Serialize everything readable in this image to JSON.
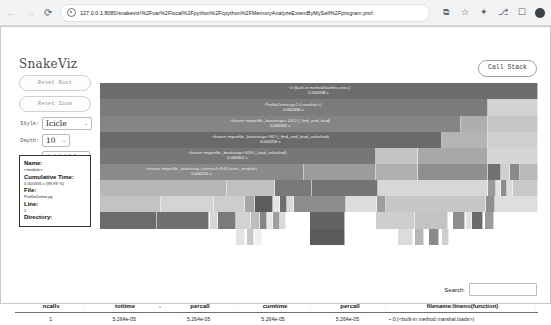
{
  "browser": {
    "url": "127.0.0.1:8080/snakeviz/%2Fvar%2Flocal%2Fpython%2Fcpython%2FMemoryAnalyzeExtemByMySelf%2Fprogram.prof",
    "nav_back": "←",
    "nav_forward": "→",
    "nav_reload": "⟳",
    "icons": {
      "site_info": "site-info-icon",
      "install": "⧉",
      "bookmark": "☆",
      "extensions": "✦",
      "split": "⎇",
      "sidepanel": "☐",
      "profile": "profile-avatar"
    }
  },
  "app": {
    "brand": "SnakeViz",
    "call_stack_button": "Call Stack"
  },
  "controls": {
    "reset_root": "Reset Root",
    "reset_zoom": "Reset Zoom",
    "style_label": "Style:",
    "style_value": "Icicle",
    "depth_label": "Depth:",
    "depth_value": "10",
    "cutoff_label": "Cutoff:",
    "cutoff_value": "1 / 1000",
    "caret": "⌄"
  },
  "info": {
    "name_label": "Name:",
    "name_value": "<module>",
    "cumulative_label": "Cumulative Time:",
    "cumulative_value": "0.000336 s (99.99 %)",
    "file_label": "File:",
    "file_value": "ProfileDemo.py",
    "line_label": "Line:",
    "line_value": "1",
    "directory_label": "Directory:",
    "directory_value": ""
  },
  "flame": {
    "rows": [
      {
        "top": 0,
        "height": 16,
        "cells": [
          {
            "left": 0,
            "width": 100,
            "color": "#6d6d6d",
            "tone": "dark",
            "label": "~:0:(built-in method builtins.exec)",
            "time": "0.000338 s"
          }
        ]
      },
      {
        "top": 16,
        "height": 17,
        "cells": [
          {
            "left": 0,
            "width": 88.5,
            "color": "#7c7c7c",
            "tone": "dark",
            "label": "ProfileDemo.py:1:(<module>)",
            "time": "0.000336 s"
          },
          {
            "left": 88.5,
            "width": 11.5,
            "color": "#d2d2d2",
            "tone": "light",
            "label": "",
            "time": ""
          }
        ]
      },
      {
        "top": 33,
        "height": 16,
        "cells": [
          {
            "left": 0,
            "width": 82.5,
            "color": "#858585",
            "tone": "dark",
            "label": "<frozen importlib._bootstrap>:1002:(_find_and_load)",
            "time": "0.000332 s"
          },
          {
            "left": 82.5,
            "width": 6.0,
            "color": "#aeaeae",
            "tone": "light",
            "label": "",
            "time": ""
          },
          {
            "left": 88.5,
            "width": 11.5,
            "color": "#c6c6c6",
            "tone": "light",
            "label": "",
            "time": ""
          }
        ]
      },
      {
        "top": 49,
        "height": 16,
        "cells": [
          {
            "left": 0,
            "width": 78.0,
            "color": "#6a6a6a",
            "tone": "dark",
            "label": "<frozen importlib._bootstrap>:967:(_find_and_load_unlocked)",
            "time": "0.000316 s"
          },
          {
            "left": 78.0,
            "width": 10.5,
            "color": "#b4b4b4",
            "tone": "light",
            "label": "",
            "time": ""
          },
          {
            "left": 88.5,
            "width": 11.5,
            "color": "#cfcfcf",
            "tone": "light",
            "label": "",
            "time": ""
          }
        ]
      },
      {
        "top": 65,
        "height": 16,
        "cells": [
          {
            "left": 0,
            "width": 63.0,
            "color": "#777777",
            "tone": "dark",
            "label": "<frozen importlib._bootstrap>:659:(_load_unlocked)",
            "time": "0.000302 s"
          },
          {
            "left": 63.0,
            "width": 9.5,
            "color": "#c4c4c4",
            "tone": "light",
            "label": "",
            "time": ""
          },
          {
            "left": 72.5,
            "width": 16.0,
            "color": "#a8a8a8",
            "tone": "light",
            "label": "",
            "time": ""
          },
          {
            "left": 88.5,
            "width": 11.5,
            "color": "#d6d6d6",
            "tone": "light",
            "label": "",
            "time": ""
          }
        ]
      },
      {
        "top": 81,
        "height": 16,
        "cells": [
          {
            "left": 0,
            "width": 46.5,
            "color": "#8a8a8a",
            "tone": "dark",
            "label": "<frozen importlib._bootstrap_external>:844:(exec_module)",
            "time": "0.000155 s"
          },
          {
            "left": 46.5,
            "width": 16.5,
            "color": "#9c9c9c",
            "tone": "light",
            "label": "",
            "time": ""
          },
          {
            "left": 63.0,
            "width": 9.5,
            "color": "#b0b0b0",
            "tone": "light",
            "label": "",
            "time": ""
          },
          {
            "left": 72.5,
            "width": 16.0,
            "color": "#8f8f8f",
            "tone": "light",
            "label": "",
            "time": ""
          },
          {
            "left": 88.5,
            "width": 3.0,
            "color": "#717171",
            "tone": "light",
            "label": "",
            "time": ""
          },
          {
            "left": 91.5,
            "width": 2.0,
            "color": "#cfcfcf",
            "tone": "light",
            "label": "",
            "time": ""
          },
          {
            "left": 93.5,
            "width": 2.5,
            "color": "#8a8a8a",
            "tone": "light",
            "label": "",
            "time": ""
          },
          {
            "left": 96.0,
            "width": 4.0,
            "color": "#b9b9b9",
            "tone": "light",
            "label": "",
            "time": ""
          }
        ]
      },
      {
        "top": 97,
        "height": 16,
        "cells": [
          {
            "left": 0,
            "width": 29.0,
            "color": "#b7b7b7",
            "tone": "light",
            "label": "",
            "time": ""
          },
          {
            "left": 29.0,
            "width": 11.0,
            "color": "#c0c0c0",
            "tone": "light",
            "label": "",
            "time": ""
          },
          {
            "left": 40.0,
            "width": 8.5,
            "color": "#787878",
            "tone": "light",
            "label": "",
            "time": ""
          },
          {
            "left": 48.5,
            "width": 15.0,
            "color": "#747474",
            "tone": "light",
            "label": "",
            "time": ""
          },
          {
            "left": 63.5,
            "width": 25.0,
            "color": "#d7d7d7",
            "tone": "light",
            "label": "",
            "time": ""
          },
          {
            "left": 88.5,
            "width": 1.8,
            "color": "#9a9a9a",
            "tone": "light",
            "label": "",
            "time": ""
          },
          {
            "left": 90.3,
            "width": 1.2,
            "color": "#e2e2e2",
            "tone": "light",
            "label": "",
            "time": ""
          },
          {
            "left": 91.5,
            "width": 1.5,
            "color": "#8d8d8d",
            "tone": "light",
            "label": "",
            "time": ""
          },
          {
            "left": 93.0,
            "width": 1.3,
            "color": "#dcdcdc",
            "tone": "light",
            "label": "",
            "time": ""
          },
          {
            "left": 94.3,
            "width": 5.7,
            "color": "#c9c9c9",
            "tone": "light",
            "label": "",
            "time": ""
          }
        ]
      },
      {
        "top": 113,
        "height": 16,
        "cells": [
          {
            "left": 0,
            "width": 14.0,
            "color": "#c3c3c3",
            "tone": "light",
            "label": "",
            "time": ""
          },
          {
            "left": 14.0,
            "width": 12.0,
            "color": "#d4d4d4",
            "tone": "light",
            "label": "",
            "time": ""
          },
          {
            "left": 26.0,
            "width": 7.0,
            "color": "#cdcdcd",
            "tone": "light",
            "label": "",
            "time": ""
          },
          {
            "left": 33.0,
            "width": 2.5,
            "color": "#a5a5a5",
            "tone": "light",
            "label": "",
            "time": ""
          },
          {
            "left": 35.5,
            "width": 4.0,
            "color": "#5c5c5c",
            "tone": "light",
            "label": "",
            "time": ""
          },
          {
            "left": 39.5,
            "width": 1.5,
            "color": "#e4e4e4",
            "tone": "light",
            "label": "",
            "time": ""
          },
          {
            "left": 41.0,
            "width": 1.8,
            "color": "#6f6f6f",
            "tone": "light",
            "label": "",
            "time": ""
          },
          {
            "left": 42.8,
            "width": 1.4,
            "color": "#d8d8d8",
            "tone": "light",
            "label": "",
            "time": ""
          },
          {
            "left": 44.2,
            "width": 12.0,
            "color": "#8c8c8c",
            "tone": "light",
            "label": "",
            "time": ""
          },
          {
            "left": 56.2,
            "width": 7.0,
            "color": "#dcdcdc",
            "tone": "light",
            "label": "",
            "time": ""
          },
          {
            "left": 63.2,
            "width": 2.0,
            "color": "#9d9d9d",
            "tone": "light",
            "label": "",
            "time": ""
          },
          {
            "left": 65.2,
            "width": 23.0,
            "color": "#c7c7c7",
            "tone": "light",
            "label": "",
            "time": ""
          },
          {
            "left": 88.2,
            "width": 2.0,
            "color": "#8f8f8f",
            "tone": "light",
            "label": "",
            "time": ""
          },
          {
            "left": 90.2,
            "width": 9.8,
            "color": "#dedede",
            "tone": "light",
            "label": "",
            "time": ""
          }
        ]
      },
      {
        "top": 129,
        "height": 17,
        "cells": [
          {
            "left": 0,
            "width": 13.0,
            "color": "#6b6b6b",
            "tone": "light",
            "label": "",
            "time": ""
          },
          {
            "left": 13.0,
            "width": 12.0,
            "color": "#6f6f6f",
            "tone": "light",
            "label": "",
            "time": ""
          },
          {
            "left": 25.0,
            "width": 2.0,
            "color": "#d6d6d6",
            "tone": "light",
            "label": "",
            "time": ""
          },
          {
            "left": 27.0,
            "width": 4.0,
            "color": "#7a7a7a",
            "tone": "light",
            "label": "",
            "time": ""
          },
          {
            "left": 31.0,
            "width": 3.5,
            "color": "#d2d2d2",
            "tone": "light",
            "label": "",
            "time": ""
          },
          {
            "left": 34.5,
            "width": 2.0,
            "color": "#bdbdbd",
            "tone": "light",
            "label": "",
            "time": ""
          },
          {
            "left": 36.5,
            "width": 1.6,
            "color": "#858585",
            "tone": "light",
            "label": "",
            "time": ""
          },
          {
            "left": 38.1,
            "width": 1.4,
            "color": "#e6e6e6",
            "tone": "light",
            "label": "",
            "time": ""
          },
          {
            "left": 39.5,
            "width": 1.6,
            "color": "#9f9f9f",
            "tone": "light",
            "label": "",
            "time": ""
          },
          {
            "left": 41.1,
            "width": 1.4,
            "color": "#dadada",
            "tone": "light",
            "label": "",
            "time": ""
          },
          {
            "left": 48.0,
            "width": 8.0,
            "color": "#636363",
            "tone": "light",
            "label": "",
            "time": ""
          },
          {
            "left": 63.0,
            "width": 9.0,
            "color": "#cecece",
            "tone": "light",
            "label": "",
            "time": ""
          },
          {
            "left": 72.0,
            "width": 7.5,
            "color": "#c3c3c3",
            "tone": "light",
            "label": "",
            "time": ""
          },
          {
            "left": 80.5,
            "width": 2.8,
            "color": "#8e8e8e",
            "tone": "light",
            "label": "",
            "time": ""
          },
          {
            "left": 83.6,
            "width": 1.4,
            "color": "#e0e0e0",
            "tone": "light",
            "label": "",
            "time": ""
          },
          {
            "left": 85.0,
            "width": 2.4,
            "color": "#6a6a6a",
            "tone": "light",
            "label": "",
            "time": ""
          },
          {
            "left": 88.0,
            "width": 2.0,
            "color": "#9b9b9b",
            "tone": "light",
            "label": "",
            "time": ""
          }
        ]
      },
      {
        "top": 146,
        "height": 16,
        "cells": [
          {
            "left": 31.0,
            "width": 2.0,
            "color": "#e3e3e3",
            "tone": "light",
            "label": "",
            "time": ""
          },
          {
            "left": 33.5,
            "width": 1.6,
            "color": "#c8c8c8",
            "tone": "light",
            "label": "",
            "time": ""
          },
          {
            "left": 35.5,
            "width": 1.4,
            "color": "#efefef",
            "tone": "light",
            "label": "",
            "time": ""
          },
          {
            "left": 48.0,
            "width": 8.0,
            "color": "#5a5a5a",
            "tone": "light",
            "label": "",
            "time": ""
          },
          {
            "left": 68.0,
            "width": 3.5,
            "color": "#dcdcdc",
            "tone": "light",
            "label": "",
            "time": ""
          },
          {
            "left": 72.0,
            "width": 2.0,
            "color": "#b6b6b6",
            "tone": "light",
            "label": "",
            "time": ""
          },
          {
            "left": 75.0,
            "width": 2.4,
            "color": "#8b8b8b",
            "tone": "light",
            "label": "",
            "time": ""
          },
          {
            "left": 78.0,
            "width": 1.6,
            "color": "#cfcfcf",
            "tone": "light",
            "label": "",
            "time": ""
          }
        ]
      }
    ]
  },
  "search": {
    "label": "Search:",
    "value": "",
    "placeholder": ""
  },
  "table": {
    "columns": [
      {
        "key": "ncalls",
        "label": "ncalls"
      },
      {
        "key": "tottime",
        "label": "tottime"
      },
      {
        "key": "percall1",
        "label": "percall"
      },
      {
        "key": "cumtime",
        "label": "cumtime"
      },
      {
        "key": "percall2",
        "label": "percall"
      },
      {
        "key": "filename",
        "label": "filename:lineno(function)"
      }
    ],
    "sort_markers": [
      "↕",
      "▴",
      "↕",
      "↕",
      "↕",
      "↕"
    ],
    "rows": [
      {
        "ncalls": "1",
        "tottime": "5.264e-05",
        "percall1": "5.264e-05",
        "cumtime": "5.264e-05",
        "percall2": "5.264e-05",
        "filename": "~:0:(<built-in method marshal.loads>)"
      }
    ]
  }
}
